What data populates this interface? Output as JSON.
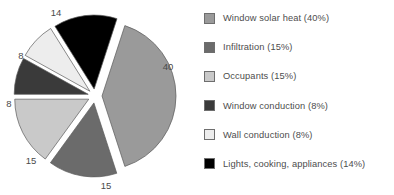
{
  "chart_data": {
    "type": "pie",
    "title": "",
    "legend_position": "right",
    "exploded": true,
    "categories": [
      "Window solar heat",
      "Infiltration",
      "Occupants",
      "Window conduction",
      "Wall conduction",
      "Lights, cooking, appliances"
    ],
    "values": [
      40,
      15,
      15,
      8,
      8,
      14
    ],
    "value_labels": [
      "40",
      "15",
      "15",
      "8",
      "8",
      "14"
    ],
    "percent_labels": [
      "40%",
      "15%",
      "15%",
      "8%",
      "8%",
      "14%"
    ],
    "colors": [
      "#9a9a9a",
      "#6b6b6b",
      "#c9c9c9",
      "#3a3a3a",
      "#ededed",
      "#000000"
    ],
    "slices": [
      {
        "name": "Window solar heat",
        "value": 40,
        "label": "40",
        "color": "#9a9a9a",
        "start_deg": -72,
        "end_deg": 72,
        "explode_deg": 0,
        "label_x": 168,
        "label_y": 67
      },
      {
        "name": "Infiltration",
        "value": 15,
        "label": "15",
        "color": "#6b6b6b",
        "start_deg": 72,
        "end_deg": 126,
        "explode_deg": 99,
        "label_x": 106,
        "label_y": 186
      },
      {
        "name": "Occupants",
        "value": 15,
        "label": "15",
        "color": "#c9c9c9",
        "start_deg": 126,
        "end_deg": 180,
        "explode_deg": 153,
        "label_x": 31,
        "label_y": 161
      },
      {
        "name": "Window conduction",
        "value": 8,
        "label": "8",
        "color": "#3a3a3a",
        "start_deg": 180,
        "end_deg": 209,
        "explode_deg": 194,
        "label_x": 9,
        "label_y": 104
      },
      {
        "name": "Wall conduction",
        "value": 8,
        "label": "8",
        "color": "#ededed",
        "start_deg": 209,
        "end_deg": 238,
        "explode_deg": 223,
        "label_x": 21,
        "label_y": 56
      },
      {
        "name": "Lights, cooking, appliances",
        "value": 14,
        "label": "14",
        "color": "#000000",
        "start_deg": 238,
        "end_deg": 288,
        "explode_deg": 263,
        "label_x": 56,
        "label_y": 13
      }
    ]
  },
  "legend": {
    "items": [
      {
        "label": "Window solar heat (40%)",
        "color": "#9a9a9a",
        "swatch_name": "legend-swatch-window-solar-heat"
      },
      {
        "label": "Infiltration (15%)",
        "color": "#6b6b6b",
        "swatch_name": "legend-swatch-infiltration"
      },
      {
        "label": "Occupants (15%)",
        "color": "#c9c9c9",
        "swatch_name": "legend-swatch-occupants"
      },
      {
        "label": "Window conduction (8%)",
        "color": "#3a3a3a",
        "swatch_name": "legend-swatch-window-conduction"
      },
      {
        "label": "Wall conduction (8%)",
        "color": "#ededed",
        "swatch_name": "legend-swatch-wall-conduction"
      },
      {
        "label": "Lights, cooking, appliances (14%)",
        "color": "#000000",
        "swatch_name": "legend-swatch-lights-cooking-appliances"
      }
    ]
  }
}
